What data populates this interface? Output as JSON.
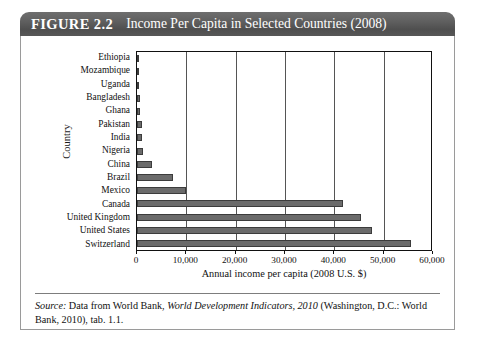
{
  "figure": {
    "label": "FIGURE 2.2",
    "title": "Income Per Capita in Selected Countries (2008)"
  },
  "colors": {
    "header_bar": "#5a5a5a",
    "header_text": "#ffffff",
    "bar_fill": "#6b6b6b",
    "bar_stroke": "#3c3c3c",
    "gridline": "#555555",
    "frame": "#9a9a9a",
    "text": "#111111"
  },
  "source": {
    "prefix": "Source:",
    "text_1": " Data from World Bank, ",
    "italic_1": "World Development Indicators, 2010",
    "text_2": " (Washington, D.C.: World Bank, 2010), tab. 1.1."
  },
  "chart_data": {
    "type": "bar",
    "orientation": "horizontal",
    "title": "Income Per Capita in Selected Countries (2008)",
    "xlabel": "Annual income per capita (2008 U.S. $)",
    "ylabel": "Country",
    "xlim": [
      0,
      60000
    ],
    "xticks": [
      0,
      10000,
      20000,
      30000,
      40000,
      50000,
      60000
    ],
    "xtick_labels": [
      "0",
      "10,000",
      "20,000",
      "30,000",
      "40,000",
      "50,000",
      "60,000"
    ],
    "grid": true,
    "grid_axis": "x",
    "legend": false,
    "units": "2008 U.S. dollars",
    "categories": [
      "Ethiopia",
      "Mozambique",
      "Uganda",
      "Bangladesh",
      "Ghana",
      "Pakistan",
      "India",
      "Nigeria",
      "China",
      "Brazil",
      "Mexico",
      "Canada",
      "United Kingdom",
      "United States",
      "Switzerland"
    ],
    "values": [
      280,
      370,
      420,
      520,
      670,
      980,
      1070,
      1160,
      2940,
      7350,
      9980,
      41730,
      45390,
      47580,
      55510
    ]
  }
}
